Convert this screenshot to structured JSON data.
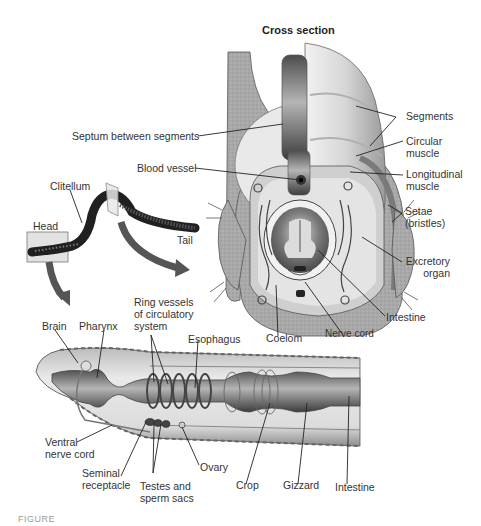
{
  "title": "Cross section",
  "colors": {
    "tissue_light": "#d9d9d9",
    "tissue_mid": "#a8a8a8",
    "tissue_dark": "#5a5a5a",
    "worm_body": "#222222",
    "arrow": "#555555",
    "highlight_box": "#e6e6e6",
    "leader_line": "#222222"
  },
  "cross_section_labels": {
    "segments": "Segments",
    "circular_muscle": "Circular muscle",
    "longitudinal_muscle": "Longitudinal muscle",
    "septum": "Septum between segments",
    "blood_vessel": "Blood vessel",
    "setae": "Setae (bristles)",
    "excretory_organ": "Excretory organ",
    "intestine": "Intestine",
    "nerve_cord": "Nerve cord",
    "coelom": "Coelom"
  },
  "whole_worm_labels": {
    "clitellum": "Clitellum",
    "head": "Head",
    "tail": "Tail"
  },
  "internal_labels": {
    "brain": "Brain",
    "pharynx": "Pharynx",
    "ring_vessels": "Ring vessels of circulatory system",
    "esophagus": "Esophagus",
    "ventral_nerve_cord": "Ventral nerve cord",
    "seminal_receptacle": "Seminal receptacle",
    "testes": "Testes and sperm sacs",
    "ovary": "Ovary",
    "crop": "Crop",
    "gizzard": "Gizzard",
    "intestine": "Intestine"
  },
  "caption": "FIGURE"
}
